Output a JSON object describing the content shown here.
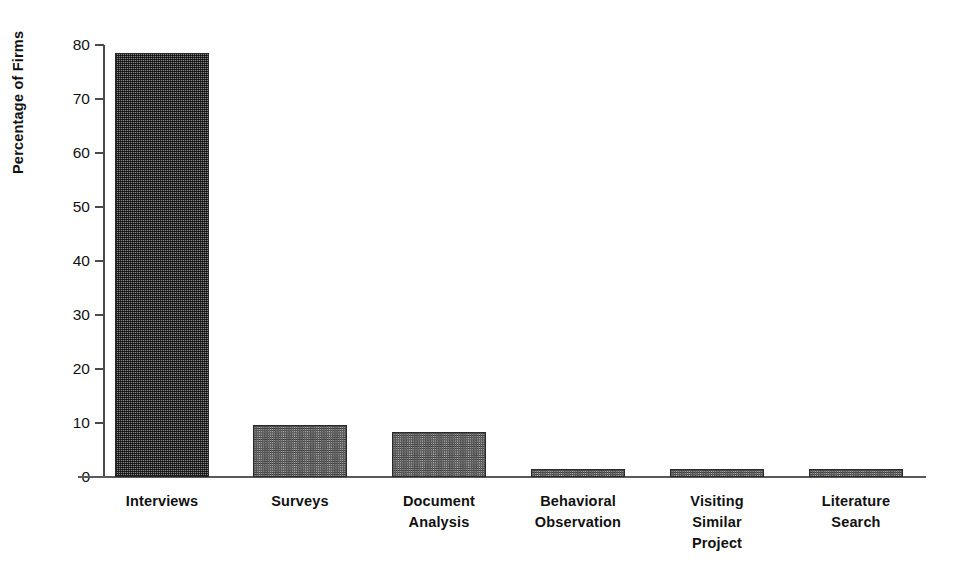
{
  "chart_data": {
    "type": "bar",
    "title": "",
    "subtitle": "",
    "xlabel": "",
    "ylabel": "Percentage of Firms",
    "categories": [
      "Interviews",
      "Surveys",
      "Document Analysis",
      "Behavioral Observation",
      "Visiting Similar Project",
      "Literature Search"
    ],
    "category_lines": [
      [
        "Interviews"
      ],
      [
        "Surveys"
      ],
      [
        "Document",
        "Analysis"
      ],
      [
        "Behavioral",
        "Observation"
      ],
      [
        "Visiting",
        "Similar",
        "Project"
      ],
      [
        "Literature",
        "Search"
      ]
    ],
    "values": [
      78.5,
      9.6,
      8.4,
      1.5,
      1.5,
      1.5
    ],
    "ylim": [
      0,
      80
    ],
    "yticks": [
      0,
      10,
      20,
      30,
      40,
      50,
      60,
      70,
      80
    ],
    "ytick_labels": [
      "0",
      "10",
      "20",
      "30",
      "40",
      "50",
      "60",
      "70",
      "80"
    ],
    "grid": false,
    "legend": false,
    "legend_position": "none",
    "bar_fill_styles": [
      "dark-dither",
      "light-dither",
      "light-dither",
      "light-dither",
      "light-dither",
      "light-dither"
    ],
    "colors": {
      "bar_dark": "#868686",
      "bar_light": "#b4b4b4",
      "bar_outline": "#2a2a2a",
      "axis": "#4a4a4a",
      "text": "#111111",
      "background": "#ffffff"
    }
  }
}
